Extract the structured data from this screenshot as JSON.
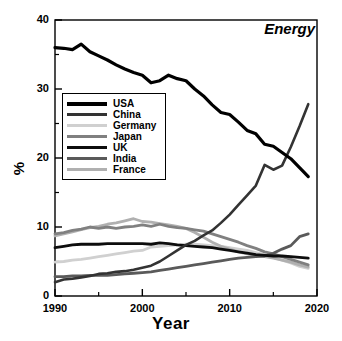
{
  "panel": {
    "title": "Energy"
  },
  "axes": {
    "xlabel": "Year",
    "ylabel": "%",
    "xticks": [
      "1990",
      "2000",
      "2010",
      "2020"
    ],
    "yticks": [
      "0",
      "10",
      "20",
      "30",
      "40"
    ]
  },
  "legend": {
    "entries": [
      {
        "label": "USA",
        "color": "#000000"
      },
      {
        "label": "China",
        "color": "#333333"
      },
      {
        "label": "Germany",
        "color": "#d0d0d0"
      },
      {
        "label": "Japan",
        "color": "#808080"
      },
      {
        "label": "UK",
        "color": "#0d0d0d"
      },
      {
        "label": "India",
        "color": "#5a5a5a"
      },
      {
        "label": "France",
        "color": "#b0b0b0"
      }
    ]
  },
  "chart_data": {
    "type": "line",
    "title": "Energy",
    "xlabel": "Year",
    "ylabel": "%",
    "xlim": [
      1990,
      2020
    ],
    "ylim": [
      0,
      40
    ],
    "grid": false,
    "legend_position": "upper-left-inset",
    "x": [
      1990,
      1991,
      1992,
      1993,
      1994,
      1995,
      1996,
      1997,
      1998,
      1999,
      2000,
      2001,
      2002,
      2003,
      2004,
      2005,
      2006,
      2007,
      2008,
      2009,
      2010,
      2011,
      2012,
      2013,
      2014,
      2015,
      2016,
      2017,
      2018,
      2019
    ],
    "series": [
      {
        "name": "USA",
        "color": "#000000",
        "width": 3.2,
        "values": [
          36.0,
          35.9,
          35.7,
          36.5,
          35.4,
          34.8,
          34.2,
          33.5,
          32.9,
          32.4,
          32.0,
          30.9,
          31.2,
          32.0,
          31.5,
          31.2,
          30.0,
          29.0,
          27.7,
          26.6,
          26.3,
          25.2,
          24.0,
          23.5,
          22.0,
          21.7,
          20.8,
          19.9,
          18.6,
          17.3
        ]
      },
      {
        "name": "China",
        "color": "#333333",
        "width": 2.6,
        "values": [
          2.0,
          2.4,
          2.5,
          2.7,
          2.9,
          3.2,
          3.3,
          3.5,
          3.6,
          3.8,
          4.1,
          4.4,
          5.0,
          5.8,
          6.6,
          7.4,
          8.0,
          8.8,
          9.5,
          10.6,
          11.8,
          13.2,
          14.6,
          16.0,
          19.0,
          18.3,
          18.9,
          21.6,
          24.6,
          27.8
        ]
      },
      {
        "name": "Germany",
        "color": "#d0d0d0",
        "width": 2.8,
        "values": [
          4.9,
          5.0,
          5.2,
          5.3,
          5.5,
          5.7,
          5.9,
          6.1,
          6.3,
          6.5,
          6.6,
          7.1,
          7.2,
          7.3,
          7.4,
          7.5,
          7.5,
          7.4,
          7.3,
          7.2,
          7.0,
          6.8,
          6.6,
          6.3,
          6.0,
          5.6,
          5.2,
          4.8,
          4.3,
          4.0
        ]
      },
      {
        "name": "Japan",
        "color": "#808080",
        "width": 2.8,
        "values": [
          9.0,
          9.2,
          9.5,
          9.7,
          10.0,
          9.8,
          10.0,
          9.8,
          10.0,
          10.1,
          10.3,
          10.1,
          10.4,
          10.1,
          9.9,
          9.8,
          9.6,
          9.4,
          9.0,
          8.6,
          8.2,
          7.8,
          7.3,
          6.9,
          6.4,
          6.1,
          5.7,
          5.3,
          4.9,
          4.5
        ]
      },
      {
        "name": "UK",
        "color": "#0d0d0d",
        "width": 2.8,
        "values": [
          7.0,
          7.2,
          7.4,
          7.5,
          7.5,
          7.5,
          7.6,
          7.6,
          7.6,
          7.6,
          7.6,
          7.5,
          7.7,
          7.6,
          7.4,
          7.3,
          7.2,
          7.1,
          7.0,
          6.8,
          6.6,
          6.4,
          6.2,
          6.0,
          5.9,
          5.8,
          5.8,
          5.7,
          5.6,
          5.5
        ]
      },
      {
        "name": "India",
        "color": "#5a5a5a",
        "width": 2.8,
        "values": [
          2.8,
          2.8,
          2.9,
          2.9,
          3.0,
          3.0,
          3.0,
          3.1,
          3.2,
          3.3,
          3.4,
          3.5,
          3.7,
          3.9,
          4.1,
          4.3,
          4.5,
          4.7,
          4.9,
          5.1,
          5.3,
          5.5,
          5.6,
          5.7,
          5.8,
          6.2,
          6.8,
          7.3,
          8.6,
          9.0
        ]
      },
      {
        "name": "France",
        "color": "#b0b0b0",
        "width": 2.8,
        "values": [
          8.7,
          9.0,
          9.3,
          9.6,
          9.9,
          10.1,
          10.4,
          10.6,
          10.9,
          11.2,
          10.8,
          10.7,
          10.5,
          10.3,
          10.1,
          9.8,
          9.2,
          8.5,
          7.8,
          7.2,
          6.8,
          6.4,
          6.1,
          5.9,
          5.7,
          5.5,
          5.2,
          4.9,
          4.5,
          4.2
        ]
      }
    ]
  }
}
